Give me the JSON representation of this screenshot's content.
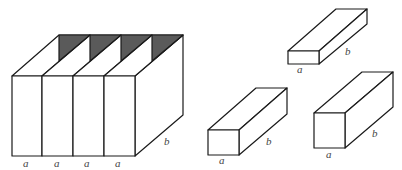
{
  "figure": {
    "big_box": {
      "bottom_labels": [
        "a",
        "a",
        "a",
        "a"
      ],
      "side_label": "b",
      "compartments": 4,
      "shade_color": "#5a5a5a"
    },
    "small_boxes": [
      {
        "id": "flat-box",
        "front_label": "a",
        "side_label": "b"
      },
      {
        "id": "medium-box",
        "front_label": "a",
        "side_label": "b"
      },
      {
        "id": "tall-box",
        "front_label": "a",
        "side_label": "b"
      }
    ]
  }
}
